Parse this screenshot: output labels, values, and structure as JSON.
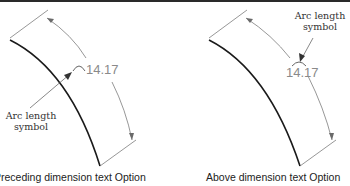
{
  "panels": [
    {
      "id": "left",
      "dimension_value": "14.17",
      "callout": {
        "line1": "Arc length",
        "line2": "symbol"
      },
      "caption": "Preceding dimension text Option"
    },
    {
      "id": "right",
      "dimension_value": "14.17",
      "callout": {
        "line1": "Arc length",
        "line2": "symbol"
      },
      "caption": "Above dimension text Option"
    }
  ],
  "colors": {
    "object_line": "#1a1a1a",
    "dimension_line": "#6a6a6a",
    "dimension_text": "#8a8a8a",
    "label_text": "#333333"
  }
}
